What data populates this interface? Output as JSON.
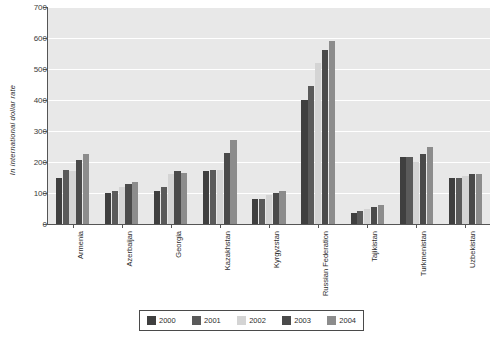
{
  "chart_data": {
    "type": "bar",
    "title": "",
    "subtitle": "",
    "xlabel": "",
    "ylabel": "In international dollar rate",
    "ylim": [
      0,
      700
    ],
    "ytick_step": 100,
    "yticks": [
      "700",
      "600",
      "500",
      "400",
      "300",
      "200",
      "100",
      "0"
    ],
    "grid": true,
    "grid_axis": "y",
    "legend_position": "bottom",
    "orientation": "vertical",
    "categories": [
      "Armenia",
      "Azerbaijan",
      "Georgia",
      "Kazakhstan",
      "Kyrgyzstan",
      "Russian Federation",
      "Tajikistan",
      "Turkmenistan",
      "Uzbekistan"
    ],
    "series": [
      {
        "name": "2000",
        "color": "#3f3f3f",
        "values": [
          150,
          100,
          105,
          170,
          80,
          400,
          35,
          215,
          150
        ]
      },
      {
        "name": "2001",
        "color": "#5a5a5a",
        "values": [
          175,
          105,
          120,
          175,
          80,
          445,
          42,
          215,
          150
        ]
      },
      {
        "name": "2002",
        "color": "#d4d4d4",
        "values": [
          170,
          120,
          160,
          175,
          95,
          520,
          50,
          200,
          155
        ]
      },
      {
        "name": "2003",
        "color": "#4a4a4a",
        "values": [
          205,
          130,
          170,
          230,
          100,
          560,
          55,
          225,
          160
        ]
      },
      {
        "name": "2004",
        "color": "#8c8c8c",
        "values": [
          225,
          135,
          165,
          270,
          105,
          590,
          60,
          250,
          160
        ]
      }
    ]
  },
  "axis": {
    "y_title": "In international dollar rate"
  },
  "legend": {
    "entries": [
      {
        "label": "2000",
        "color": "#3f3f3f"
      },
      {
        "label": "2001",
        "color": "#5a5a5a"
      },
      {
        "label": "2002",
        "color": "#d4d4d4"
      },
      {
        "label": "2003",
        "color": "#4a4a4a"
      },
      {
        "label": "2004",
        "color": "#8c8c8c"
      }
    ]
  },
  "colors": {
    "plot_background": "#e8e8e8",
    "gridline": "#ffffff",
    "axis": "#555555",
    "page_background": "#ffffff"
  }
}
